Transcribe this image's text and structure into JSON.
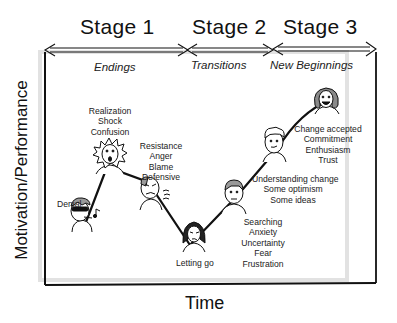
{
  "diagram": {
    "stages": [
      {
        "label": "Stage 1",
        "phase": "Endings"
      },
      {
        "label": "Stage 2",
        "phase": "Transitions"
      },
      {
        "label": "Stage 3",
        "phase": "New Beginnings"
      }
    ],
    "axes": {
      "y_label": "Motivation/Performance",
      "x_label": "Time"
    },
    "points": [
      {
        "name": "denial",
        "label_lines": [
          "Denial"
        ]
      },
      {
        "name": "shock",
        "label_lines": [
          "Realization",
          "Shock",
          "Confusion"
        ]
      },
      {
        "name": "resistance",
        "label_lines": [
          "Resistance",
          "Anger",
          "Blame",
          "Defensive"
        ]
      },
      {
        "name": "letting-go",
        "label_lines": [
          "Letting go"
        ]
      },
      {
        "name": "searching",
        "label_lines": [
          "Searching",
          "Anxiety",
          "Uncertainty",
          "Fear",
          "Frustration"
        ]
      },
      {
        "name": "understanding",
        "label_lines": [
          "Understanding change",
          "Some optimism",
          "Some ideas"
        ]
      },
      {
        "name": "acceptance",
        "label_lines": [
          "Change accepted",
          "Commitment",
          "Enthusiasm",
          "Trust"
        ]
      }
    ],
    "colors": {
      "line": "#111111",
      "shadow": "#d6d6d6",
      "hair": "#8a8a8a"
    }
  }
}
